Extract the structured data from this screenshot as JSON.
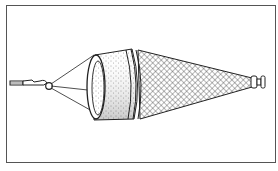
{
  "figure": {
    "parts": [
      "towline",
      "swivel",
      "bridle",
      "mouth-ring",
      "canvas-collar",
      "mesh-cone",
      "cod-end"
    ],
    "colors": {
      "ink": "#222222",
      "frame": "#555555",
      "background": "#ffffff"
    }
  }
}
